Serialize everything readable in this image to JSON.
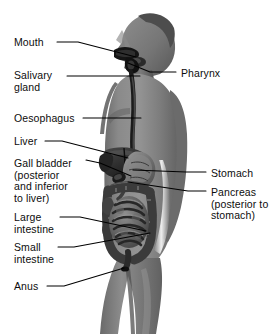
{
  "figure": {
    "width": 279,
    "height": 334,
    "background_color": "#ffffff",
    "line_color": "#000000",
    "text_color": "#0d0d0d"
  },
  "labels_left": [
    {
      "id": "mouth",
      "lines": [
        "Mouth"
      ],
      "x": 14,
      "y": 37
    },
    {
      "id": "salivary",
      "lines": [
        "Salivary",
        "gland"
      ],
      "x": 14,
      "y": 70
    },
    {
      "id": "oesophagus",
      "lines": [
        "Oesophagus"
      ],
      "x": 14,
      "y": 113
    },
    {
      "id": "liver",
      "lines": [
        "Liver"
      ],
      "x": 14,
      "y": 136
    },
    {
      "id": "gall-bladder",
      "lines": [
        "Gall bladder",
        "(posterior",
        "and inferior",
        "to liver)"
      ],
      "x": 14,
      "y": 158
    },
    {
      "id": "large-intestine",
      "lines": [
        "Large",
        "intestine"
      ],
      "x": 14,
      "y": 212
    },
    {
      "id": "small-intestine",
      "lines": [
        "Small",
        "intestine"
      ],
      "x": 14,
      "y": 242
    },
    {
      "id": "anus",
      "lines": [
        "Anus"
      ],
      "x": 14,
      "y": 281
    }
  ],
  "labels_right": [
    {
      "id": "pharynx",
      "lines": [
        "Pharynx"
      ],
      "x": 181,
      "y": 68
    },
    {
      "id": "stomach",
      "lines": [
        "Stomach"
      ],
      "x": 211,
      "y": 168
    },
    {
      "id": "pancreas",
      "lines": [
        "Pancreas",
        "(posterior to",
        "stomach)"
      ],
      "x": 211,
      "y": 187
    }
  ],
  "leaders": [
    {
      "id": "mouth-leader",
      "points": "57,42 78,42 136,57"
    },
    {
      "id": "salivary-leader",
      "points": "67,76 140,76"
    },
    {
      "id": "oesophagus-leader",
      "points": "83,118 141,118"
    },
    {
      "id": "liver-leader",
      "points": "45,141 62,141 128,158"
    },
    {
      "id": "gall-bladder-leader",
      "points": "86,160 100,163 131,176"
    },
    {
      "id": "large-intestine-leader",
      "points": "60,217 80,217 146,231"
    },
    {
      "id": "small-intestine-leader",
      "points": "58,247 74,247 150,233"
    },
    {
      "id": "anus-leader",
      "points": "47,286 64,286 124,268"
    },
    {
      "id": "pharynx-leader",
      "points": "176,72 150,72 128,63"
    },
    {
      "id": "stomach-leader",
      "points": "206,172 186,172 133,170"
    },
    {
      "id": "pancreas-leader",
      "points": "206,191 188,191 128,182"
    }
  ],
  "organs": [
    {
      "id": "mouth-cavity",
      "name": "mouth"
    },
    {
      "id": "salivary-gland",
      "name": "salivary gland"
    },
    {
      "id": "pharynx-organ",
      "name": "pharynx"
    },
    {
      "id": "oesophagus-tube",
      "name": "oesophagus"
    },
    {
      "id": "liver-organ",
      "name": "liver"
    },
    {
      "id": "gall-bladder-organ",
      "name": "gall bladder"
    },
    {
      "id": "stomach-organ",
      "name": "stomach"
    },
    {
      "id": "pancreas-organ",
      "name": "pancreas"
    },
    {
      "id": "large-intestine-organ",
      "name": "large intestine"
    },
    {
      "id": "small-intestine-organ",
      "name": "small intestine"
    },
    {
      "id": "anus-organ",
      "name": "anus"
    }
  ]
}
